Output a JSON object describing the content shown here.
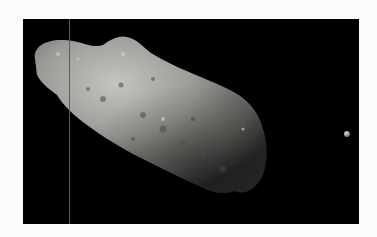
{
  "image": {
    "subject": "Asteroid with small moon against black space background",
    "background_color": "#000000",
    "frame_color": "#fbfbfb",
    "elements": [
      {
        "name": "asteroid",
        "description": "elongated cratered grey asteroid"
      },
      {
        "name": "moon",
        "description": "small bright moon to the right"
      },
      {
        "name": "vertical-artifact-line",
        "description": "thin grey vertical line"
      }
    ]
  }
}
